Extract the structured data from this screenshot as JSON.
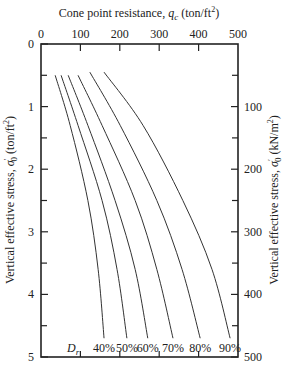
{
  "chart_data": {
    "type": "line",
    "title": "",
    "xlabel": "Cone point resistance, q_c (ton/ft²)",
    "ylabel_left": "Vertical effective stress, σ'0 (ton/ft²)",
    "ylabel_right": "Vertical effective stress, σ'0 (kN/m²)",
    "x_axis_position": "top",
    "xlim": [
      0,
      500
    ],
    "ylim_left": [
      0,
      5
    ],
    "ylim_right": [
      0,
      500
    ],
    "y_inverted": true,
    "x_ticks": [
      0,
      100,
      200,
      300,
      400,
      500
    ],
    "y_ticks_left": [
      0,
      1,
      2,
      3,
      4,
      5
    ],
    "y_ticks_right": [
      100,
      200,
      300,
      400,
      500
    ],
    "grid": false,
    "legend_label": "D_r",
    "series": [
      {
        "name": "40%",
        "points": [
          [
            36,
            0.5
          ],
          [
            74,
            1.3
          ],
          [
            119,
            2.5
          ],
          [
            145,
            3.6
          ],
          [
            160,
            4.7
          ]
        ]
      },
      {
        "name": "50%",
        "points": [
          [
            51,
            0.5
          ],
          [
            94,
            1.3
          ],
          [
            155,
            2.5
          ],
          [
            193,
            3.6
          ],
          [
            218,
            4.7
          ]
        ]
      },
      {
        "name": "60%",
        "points": [
          [
            69,
            0.5
          ],
          [
            119,
            1.3
          ],
          [
            188,
            2.5
          ],
          [
            239,
            3.6
          ],
          [
            271,
            4.7
          ]
        ]
      },
      {
        "name": "70%",
        "points": [
          [
            94,
            0.5
          ],
          [
            155,
            1.3
          ],
          [
            239,
            2.5
          ],
          [
            294,
            3.6
          ],
          [
            335,
            4.7
          ]
        ]
      },
      {
        "name": "80%",
        "points": [
          [
            124,
            0.45
          ],
          [
            201,
            1.3
          ],
          [
            294,
            2.5
          ],
          [
            358,
            3.6
          ],
          [
            404,
            4.7
          ]
        ]
      },
      {
        "name": "90%",
        "points": [
          [
            160,
            0.45
          ],
          [
            259,
            1.3
          ],
          [
            360,
            2.5
          ],
          [
            434,
            3.6
          ],
          [
            480,
            4.7
          ]
        ]
      }
    ]
  },
  "labels": {
    "x_title_prefix": "Cone point resistance, ",
    "x_title_var": "q",
    "x_title_sub": "c",
    "x_title_suffix": " (ton/ft",
    "x_title_sup": "2",
    "x_title_end": ")",
    "left_title_prefix": "Vertical effective stress, ",
    "left_title_var": "σ",
    "left_title_mark": "′",
    "left_title_sub": "0",
    "left_title_suffix": " (ton/ft",
    "left_title_sup": "2",
    "left_title_end": ")",
    "right_title_prefix": "Vertical effective stress, ",
    "right_title_var": "σ",
    "right_title_mark": "′",
    "right_title_sub": "0",
    "right_title_suffix": " (kN/m",
    "right_title_sup": "2",
    "right_title_end": ")",
    "dr_var": "D",
    "dr_sub": "r"
  }
}
